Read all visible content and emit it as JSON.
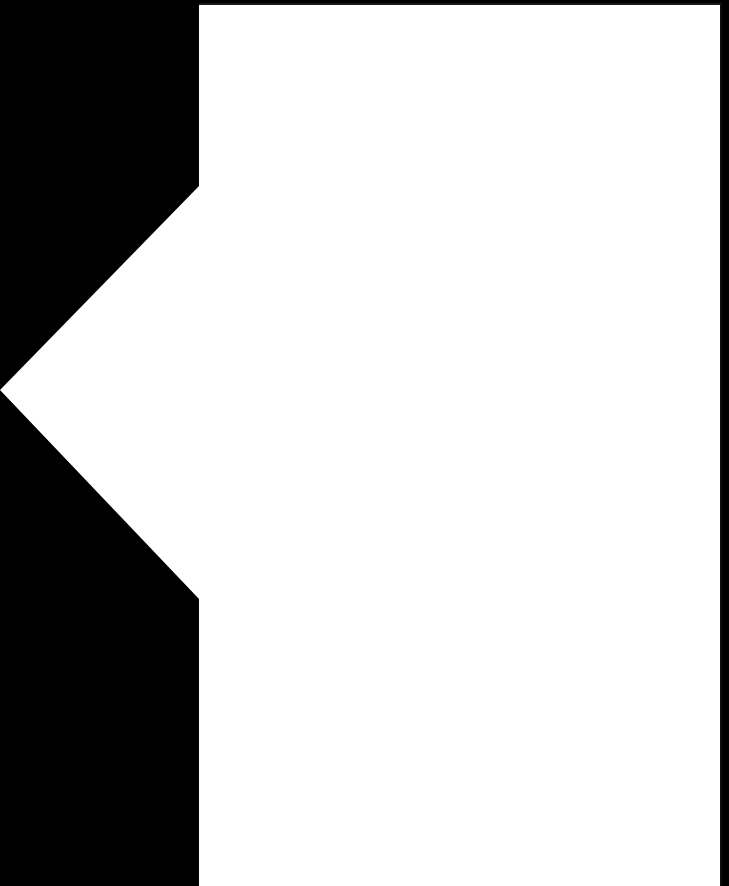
{
  "screen": {
    "width": 729,
    "height": 886,
    "background_color": "#000000"
  },
  "backdrop": {
    "name": "dimmed-backdrop",
    "color": "#000000",
    "width": 200,
    "label": ""
  },
  "panel": {
    "name": "content-panel",
    "background_color": "#ffffff",
    "border_color": "#1a1a1a",
    "left": 199,
    "top": 3,
    "width": 523,
    "height": 883,
    "title": "",
    "body_text": ""
  },
  "chevron": {
    "name": "collapse-chevron",
    "icon": "chevron-left-icon",
    "color": "#ffffff",
    "tip_x": 0,
    "tip_y": 390,
    "top_y": 185,
    "bottom_y": 600,
    "base_x": 199,
    "label": ""
  }
}
